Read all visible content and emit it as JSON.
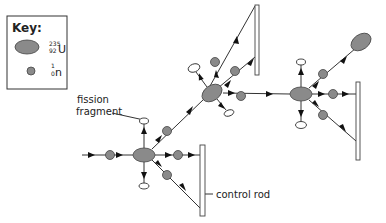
{
  "key": {
    "title": "Key:",
    "uranium": {
      "mass_number": "235",
      "atomic_number": "92",
      "symbol": "U"
    },
    "neutron": {
      "mass_number": "1",
      "atomic_number": "0",
      "symbol": "n"
    }
  },
  "labels": {
    "fission_fragment_line1": "fission",
    "fission_fragment_line2": "fragment",
    "control_rod": "control rod"
  },
  "colors": {
    "nucleus_fill": "#8a8a8a",
    "line": "#333333",
    "background": "#ffffff"
  }
}
